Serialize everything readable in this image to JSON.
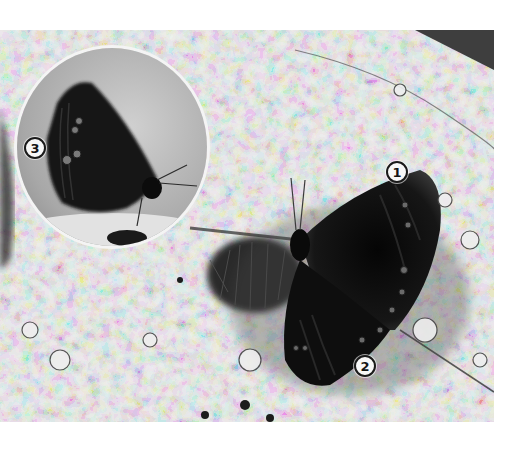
{
  "figure": {
    "style": "grayscale photograph with circular inset",
    "inset": {
      "subject": "butterfly side view, wings closed",
      "shape": "circle"
    },
    "callouts": [
      {
        "id": "1",
        "label": "1",
        "position": "forewing tip"
      },
      {
        "id": "2",
        "label": "2",
        "position": "hindwing margin eyespots"
      },
      {
        "id": "3",
        "label": "3",
        "position": "underside forewing eyespots (inset)"
      }
    ]
  },
  "colors": {
    "background": "#ffffff",
    "rock_light": "#d8d8d8",
    "rock_dark": "#5a5a5a",
    "butterfly": "#141414",
    "marker_fill": "#f8f8f8",
    "marker_border": "#1a1a1a",
    "inset_border": "#f4f4f4"
  }
}
